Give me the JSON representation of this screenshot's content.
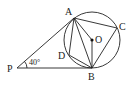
{
  "diagram": {
    "type": "geometry",
    "points": {
      "P": {
        "label": "P",
        "x": 17,
        "y": 68
      },
      "A": {
        "label": "A",
        "x": 74,
        "y": 18
      },
      "B": {
        "label": "B",
        "x": 92,
        "y": 68
      },
      "C": {
        "label": "C",
        "x": 117,
        "y": 28
      },
      "D": {
        "label": "D",
        "x": 69,
        "y": 55
      },
      "O": {
        "label": "O",
        "x": 92,
        "y": 40
      }
    },
    "circle": {
      "center": "O",
      "r": 28
    },
    "angle_label": "40°",
    "segments": [
      "PA",
      "PB",
      "AB",
      "AC",
      "BC",
      "AD",
      "DB",
      "AO",
      "OB"
    ],
    "line_color": "#222222"
  }
}
